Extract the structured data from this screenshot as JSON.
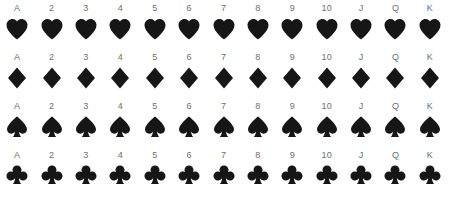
{
  "deck": {
    "title": "Standard 52-card deck suit and rank grid",
    "background_color": "#ffffff",
    "symbol_color": "#161616",
    "label_color": "#6e6e6e",
    "ranks": [
      "A",
      "2",
      "3",
      "4",
      "5",
      "6",
      "7",
      "8",
      "9",
      "10",
      "J",
      "Q",
      "K"
    ],
    "rows": [
      {
        "suit": "hearts",
        "suit_icon": "heart-icon",
        "color": "#161616",
        "labels": [
          "A",
          "2",
          "3",
          "4",
          "5",
          "6",
          "7",
          "8",
          "9",
          "10",
          "J",
          "Q",
          "K"
        ]
      },
      {
        "suit": "diamonds",
        "suit_icon": "diamond-icon",
        "color": "#161616",
        "labels": [
          "A",
          "2",
          "3",
          "4",
          "5",
          "6",
          "7",
          "8",
          "9",
          "10",
          "J",
          "Q",
          "K"
        ]
      },
      {
        "suit": "spades",
        "suit_icon": "spade-icon",
        "color": "#161616",
        "labels": [
          "A",
          "2",
          "3",
          "4",
          "5",
          "6",
          "7",
          "8",
          "9",
          "10",
          "J",
          "Q",
          "K"
        ]
      },
      {
        "suit": "clubs",
        "suit_icon": "club-icon",
        "color": "#161616",
        "labels": [
          "A",
          "2",
          "3",
          "4",
          "5",
          "6",
          "7",
          "8",
          "9",
          "10",
          "J",
          "Q",
          "K"
        ]
      }
    ]
  }
}
